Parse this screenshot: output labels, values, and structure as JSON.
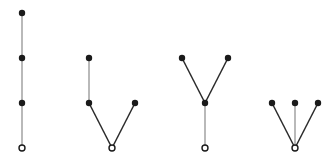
{
  "diagram": {
    "colors": {
      "node_fill": "#1a1a1a",
      "root_stroke": "#1a1a1a",
      "root_fill": "#ffffff",
      "edge_vertical": "#8a8a8a",
      "edge_diagonal": "#2a2a2a"
    },
    "trees": [
      {
        "id": "path-tree",
        "nodes": [
          {
            "x": 22,
            "y": 13,
            "root": false
          },
          {
            "x": 22,
            "y": 58,
            "root": false
          },
          {
            "x": 22,
            "y": 103,
            "root": false
          },
          {
            "x": 22,
            "y": 148,
            "root": true
          }
        ],
        "edges": [
          [
            0,
            1
          ],
          [
            1,
            2
          ],
          [
            2,
            3
          ]
        ]
      },
      {
        "id": "branch-left-tree",
        "nodes": [
          {
            "x": 89,
            "y": 58,
            "root": false
          },
          {
            "x": 89,
            "y": 103,
            "root": false
          },
          {
            "x": 135,
            "y": 103,
            "root": false
          },
          {
            "x": 112,
            "y": 148,
            "root": true
          }
        ],
        "edges": [
          [
            0,
            1
          ],
          [
            1,
            3
          ],
          [
            2,
            3
          ]
        ]
      },
      {
        "id": "y-tree",
        "nodes": [
          {
            "x": 182,
            "y": 58,
            "root": false
          },
          {
            "x": 228,
            "y": 58,
            "root": false
          },
          {
            "x": 205,
            "y": 103,
            "root": false
          },
          {
            "x": 205,
            "y": 148,
            "root": true
          }
        ],
        "edges": [
          [
            0,
            2
          ],
          [
            1,
            2
          ],
          [
            2,
            3
          ]
        ]
      },
      {
        "id": "star-tree",
        "nodes": [
          {
            "x": 272,
            "y": 103,
            "root": false
          },
          {
            "x": 295,
            "y": 103,
            "root": false
          },
          {
            "x": 318,
            "y": 103,
            "root": false
          },
          {
            "x": 295,
            "y": 148,
            "root": true
          }
        ],
        "edges": [
          [
            0,
            3
          ],
          [
            1,
            3
          ],
          [
            2,
            3
          ]
        ]
      }
    ]
  }
}
